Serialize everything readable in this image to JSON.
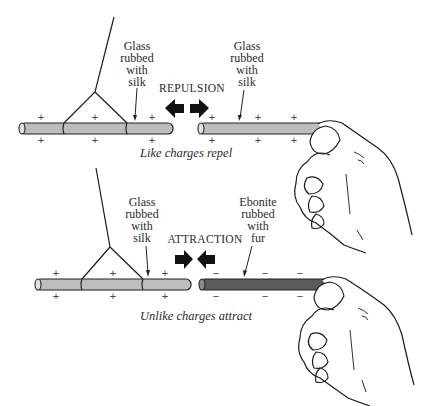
{
  "top_panel": {
    "left_rod_label": "Glass\nrubbed\nwith\nsilk",
    "right_rod_label": "Glass\nrubbed\nwith\nsilk",
    "force_label": "REPULSION",
    "caption": "Like charges repel",
    "left_rod_charges_above": [
      "+",
      "+",
      "+"
    ],
    "left_rod_charges_below": [
      "+",
      "+",
      "+"
    ],
    "right_rod_charges_above": [
      "+",
      "+",
      "+"
    ],
    "right_rod_charges_below": [
      "+",
      "+",
      "+"
    ],
    "arrows": "outward"
  },
  "bottom_panel": {
    "left_rod_label": "Glass\nrubbed\nwith\nsilk",
    "right_rod_label": "Ebonite\nrubbed\nwith\nfur",
    "force_label": "ATTRACTION",
    "caption": "Unlike charges attract",
    "left_rod_charges_above": [
      "+",
      "+",
      "+"
    ],
    "left_rod_charges_below": [
      "+",
      "+",
      "+"
    ],
    "right_rod_charges_above": [
      "−",
      "−",
      "−"
    ],
    "right_rod_charges_below": [
      "−",
      "−",
      "−"
    ],
    "arrows": "inward"
  },
  "colors": {
    "glass_rod": "#bdbdbd",
    "ebonite_rod": "#5a5a5a",
    "ink": "#1a1a1a"
  }
}
